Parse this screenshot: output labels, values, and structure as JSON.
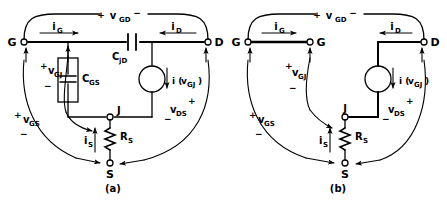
{
  "figure": {
    "panels": [
      {
        "id": "a",
        "caption": "(a)",
        "terminals": [
          {
            "name": "G",
            "label": "G",
            "x": 24,
            "y": 42
          },
          {
            "name": "D",
            "label": "D",
            "x": 208,
            "y": 42
          },
          {
            "name": "J",
            "label": "J",
            "x": 110,
            "y": 117
          },
          {
            "name": "S",
            "label": "S",
            "x": 110,
            "y": 163
          }
        ],
        "components": [
          {
            "name": "C_jD",
            "type": "capacitor",
            "label_main": "C",
            "label_sub": "jD"
          },
          {
            "name": "C_GS",
            "type": "boxed-capacitor",
            "label_main": "C",
            "label_sub": "GS"
          },
          {
            "name": "R_S",
            "type": "resistor",
            "label_main": "R",
            "label_sub": "S"
          },
          {
            "name": "i(v_GJ)",
            "type": "current-source",
            "label_main": "i ( v",
            "label_sub": "GJ",
            "label_tail": " )"
          }
        ],
        "currents": [
          {
            "name": "i_G",
            "label_main": "i",
            "label_sub": "G",
            "direction": "right"
          },
          {
            "name": "i_D",
            "label_main": "i",
            "label_sub": "D",
            "direction": "left"
          },
          {
            "name": "i_S",
            "label_main": "i",
            "label_sub": "S",
            "direction": "up"
          }
        ],
        "voltages": [
          {
            "name": "v_GD",
            "label_main": "v",
            "label_sub": "GD",
            "plus": "+",
            "minus": "−"
          },
          {
            "name": "v_GJ",
            "label_main": "v",
            "label_sub": "GJ",
            "plus": "+",
            "minus": "−"
          },
          {
            "name": "v_GS",
            "label_main": "v",
            "label_sub": "GS",
            "plus": "+",
            "minus": "−"
          },
          {
            "name": "v_DS",
            "label_main": "v",
            "label_sub": "DS",
            "plus": "+",
            "minus": "−"
          }
        ]
      },
      {
        "id": "b",
        "caption": "(b)",
        "terminals": [
          {
            "name": "G-left",
            "label": "G",
            "x": 248,
            "y": 42
          },
          {
            "name": "G-right",
            "label": "G",
            "x": 310,
            "y": 42
          },
          {
            "name": "D",
            "label": "D",
            "x": 424,
            "y": 42
          },
          {
            "name": "J",
            "label": "J",
            "x": 345,
            "y": 117
          },
          {
            "name": "S",
            "label": "S",
            "x": 345,
            "y": 163
          }
        ],
        "components": [
          {
            "name": "R_S",
            "type": "resistor",
            "label_main": "R",
            "label_sub": "S"
          },
          {
            "name": "i(v_GJ)",
            "type": "current-source",
            "label_main": "i ( v",
            "label_sub": "GJ",
            "label_tail": " )"
          }
        ],
        "currents": [
          {
            "name": "i_G",
            "label_main": "i",
            "label_sub": "G",
            "direction": "right"
          },
          {
            "name": "i_D",
            "label_main": "i",
            "label_sub": "D",
            "direction": "left"
          },
          {
            "name": "i_S",
            "label_main": "i",
            "label_sub": "S",
            "direction": "up"
          }
        ],
        "voltages": [
          {
            "name": "v_GD",
            "label_main": "v",
            "label_sub": "GD",
            "plus": "+",
            "minus": "−"
          },
          {
            "name": "v_GJ",
            "label_main": "v",
            "label_sub": "GJ",
            "plus": "+",
            "minus": "−"
          },
          {
            "name": "v_GS",
            "label_main": "v",
            "label_sub": "GS",
            "plus": "+",
            "minus": "−"
          },
          {
            "name": "v_DS",
            "label_main": "v",
            "label_sub": "DS",
            "plus": "+",
            "minus": "−"
          }
        ]
      }
    ],
    "colors": {
      "ink": "#000000",
      "background": "#ffffff"
    }
  },
  "text": {
    "G": "G",
    "D": "D",
    "J": "J",
    "S": "S",
    "plus": "+",
    "minus": "−",
    "i": "i",
    "v": "v",
    "C": "C",
    "R": "R",
    "sub_G": "G",
    "sub_D": "D",
    "sub_S": "S",
    "sub_jD": "jD",
    "sub_GS": "GS",
    "sub_GD": "GD",
    "sub_GJ": "GJ",
    "sub_DS": "DS",
    "isrc_open": "i (",
    "isrc_close": ")",
    "caption_a": "(a)",
    "caption_b": "(b)"
  }
}
